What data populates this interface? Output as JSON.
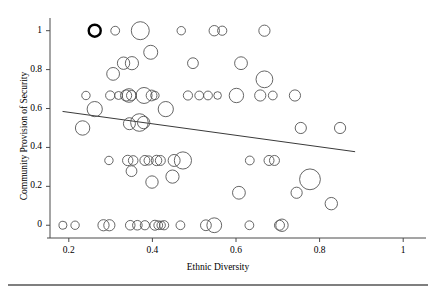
{
  "chart_data": {
    "type": "scatter",
    "title": "",
    "xlabel": "Ethnic Diversity",
    "ylabel": "Community Provision of Security",
    "xlim": [
      0.155,
      1.045
    ],
    "ylim": [
      -0.045,
      1.055
    ],
    "xticks": [
      0.2,
      0.4,
      0.6,
      0.8,
      1
    ],
    "xtick_labels": [
      "0.2",
      "0.4",
      "0.6",
      "0.8",
      "1"
    ],
    "yticks": [
      0,
      0.2,
      0.4,
      0.6,
      0.8,
      1
    ],
    "ytick_labels": [
      "0",
      "0.2",
      "0.4",
      "0.6",
      "0.8",
      "1"
    ],
    "grid": false,
    "legend": null,
    "marker_style": "open circle, size proportional to weight",
    "trendline": {
      "type": "linear fit",
      "x": [
        0.185,
        0.885
      ],
      "y": [
        0.585,
        0.378
      ]
    },
    "highlighted_point": {
      "x": 0.262,
      "y": 1.0,
      "r": 6.0,
      "note": "bold outlined marker"
    },
    "points": [
      {
        "x": 0.262,
        "y": 1.0,
        "r": 6.0,
        "bold": true
      },
      {
        "x": 0.311,
        "y": 1.0,
        "r": 4.4
      },
      {
        "x": 0.371,
        "y": 1.0,
        "r": 9.0
      },
      {
        "x": 0.469,
        "y": 1.0,
        "r": 4.2
      },
      {
        "x": 0.548,
        "y": 1.0,
        "r": 5.2
      },
      {
        "x": 0.567,
        "y": 1.0,
        "r": 4.6
      },
      {
        "x": 0.668,
        "y": 1.0,
        "r": 5.6
      },
      {
        "x": 0.396,
        "y": 0.889,
        "r": 7.0
      },
      {
        "x": 0.331,
        "y": 0.833,
        "r": 6.2
      },
      {
        "x": 0.351,
        "y": 0.833,
        "r": 6.6
      },
      {
        "x": 0.497,
        "y": 0.833,
        "r": 5.4
      },
      {
        "x": 0.612,
        "y": 0.833,
        "r": 6.4
      },
      {
        "x": 0.306,
        "y": 0.778,
        "r": 6.4
      },
      {
        "x": 0.668,
        "y": 0.75,
        "r": 8.4
      },
      {
        "x": 0.241,
        "y": 0.667,
        "r": 4.2
      },
      {
        "x": 0.299,
        "y": 0.667,
        "r": 4.6
      },
      {
        "x": 0.319,
        "y": 0.667,
        "r": 4.0
      },
      {
        "x": 0.337,
        "y": 0.667,
        "r": 5.6
      },
      {
        "x": 0.344,
        "y": 0.667,
        "r": 6.8
      },
      {
        "x": 0.35,
        "y": 0.667,
        "r": 5.0
      },
      {
        "x": 0.38,
        "y": 0.667,
        "r": 8.0
      },
      {
        "x": 0.398,
        "y": 0.667,
        "r": 5.4
      },
      {
        "x": 0.406,
        "y": 0.667,
        "r": 4.2
      },
      {
        "x": 0.485,
        "y": 0.667,
        "r": 4.6
      },
      {
        "x": 0.512,
        "y": 0.667,
        "r": 4.4
      },
      {
        "x": 0.533,
        "y": 0.667,
        "r": 4.4
      },
      {
        "x": 0.556,
        "y": 0.667,
        "r": 3.8
      },
      {
        "x": 0.601,
        "y": 0.667,
        "r": 7.2
      },
      {
        "x": 0.658,
        "y": 0.667,
        "r": 5.6
      },
      {
        "x": 0.688,
        "y": 0.667,
        "r": 4.4
      },
      {
        "x": 0.741,
        "y": 0.667,
        "r": 5.6
      },
      {
        "x": 0.262,
        "y": 0.597,
        "r": 7.6
      },
      {
        "x": 0.432,
        "y": 0.597,
        "r": 7.6
      },
      {
        "x": 0.369,
        "y": 0.528,
        "r": 8.8
      },
      {
        "x": 0.379,
        "y": 0.528,
        "r": 6.2
      },
      {
        "x": 0.345,
        "y": 0.522,
        "r": 6.0
      },
      {
        "x": 0.233,
        "y": 0.5,
        "r": 7.2
      },
      {
        "x": 0.755,
        "y": 0.5,
        "r": 5.6
      },
      {
        "x": 0.849,
        "y": 0.5,
        "r": 5.6
      },
      {
        "x": 0.296,
        "y": 0.333,
        "r": 4.2
      },
      {
        "x": 0.341,
        "y": 0.333,
        "r": 5.2
      },
      {
        "x": 0.354,
        "y": 0.333,
        "r": 4.8
      },
      {
        "x": 0.382,
        "y": 0.333,
        "r": 5.0
      },
      {
        "x": 0.391,
        "y": 0.333,
        "r": 4.6
      },
      {
        "x": 0.41,
        "y": 0.333,
        "r": 5.2
      },
      {
        "x": 0.419,
        "y": 0.333,
        "r": 5.0
      },
      {
        "x": 0.452,
        "y": 0.333,
        "r": 6.0
      },
      {
        "x": 0.473,
        "y": 0.333,
        "r": 8.6
      },
      {
        "x": 0.633,
        "y": 0.333,
        "r": 4.4
      },
      {
        "x": 0.679,
        "y": 0.333,
        "r": 5.0
      },
      {
        "x": 0.692,
        "y": 0.333,
        "r": 5.0
      },
      {
        "x": 0.35,
        "y": 0.278,
        "r": 5.4
      },
      {
        "x": 0.448,
        "y": 0.25,
        "r": 6.6
      },
      {
        "x": 0.777,
        "y": 0.236,
        "r": 10.4
      },
      {
        "x": 0.399,
        "y": 0.222,
        "r": 6.2
      },
      {
        "x": 0.607,
        "y": 0.167,
        "r": 6.4
      },
      {
        "x": 0.745,
        "y": 0.167,
        "r": 5.6
      },
      {
        "x": 0.828,
        "y": 0.111,
        "r": 6.2
      },
      {
        "x": 0.186,
        "y": 0.0,
        "r": 4.0
      },
      {
        "x": 0.215,
        "y": 0.0,
        "r": 4.2
      },
      {
        "x": 0.283,
        "y": 0.0,
        "r": 5.6
      },
      {
        "x": 0.297,
        "y": 0.0,
        "r": 5.6
      },
      {
        "x": 0.347,
        "y": 0.0,
        "r": 4.8
      },
      {
        "x": 0.364,
        "y": 0.0,
        "r": 4.8
      },
      {
        "x": 0.382,
        "y": 0.0,
        "r": 4.6
      },
      {
        "x": 0.406,
        "y": 0.0,
        "r": 5.0
      },
      {
        "x": 0.414,
        "y": 0.0,
        "r": 4.4
      },
      {
        "x": 0.421,
        "y": 0.0,
        "r": 4.2
      },
      {
        "x": 0.428,
        "y": 0.0,
        "r": 4.6
      },
      {
        "x": 0.467,
        "y": 0.0,
        "r": 4.4
      },
      {
        "x": 0.528,
        "y": 0.0,
        "r": 5.4
      },
      {
        "x": 0.548,
        "y": 0.0,
        "r": 7.4
      },
      {
        "x": 0.632,
        "y": 0.0,
        "r": 4.4
      },
      {
        "x": 0.704,
        "y": 0.0,
        "r": 5.0
      },
      {
        "x": 0.71,
        "y": 0.0,
        "r": 6.2
      }
    ]
  },
  "footer_rule": true
}
